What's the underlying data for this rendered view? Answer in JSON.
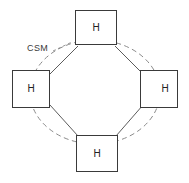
{
  "diagram": {
    "background_color": "#ffffff",
    "stroke_color": "#3a3a3a",
    "dashed_stroke_color": "#8a8a8a",
    "link_stroke_color": "#4a4a4a",
    "annotation": {
      "label": "CSM",
      "color": "#3a3a3a"
    },
    "nodes": [
      {
        "id": "top",
        "label": "H",
        "position": "top"
      },
      {
        "id": "left",
        "label": "H",
        "position": "left"
      },
      {
        "id": "right",
        "label": "H",
        "position": "right"
      },
      {
        "id": "bottom",
        "label": "H",
        "position": "bottom"
      }
    ],
    "links": [
      {
        "from": "top",
        "to": "right"
      },
      {
        "from": "right",
        "to": "bottom"
      },
      {
        "from": "bottom",
        "to": "left"
      },
      {
        "from": "left",
        "to": "top"
      }
    ],
    "ellipse": {
      "style": "dashed",
      "center_x": 95,
      "center_y": 92,
      "radius_x": 65,
      "radius_y": 52
    }
  }
}
